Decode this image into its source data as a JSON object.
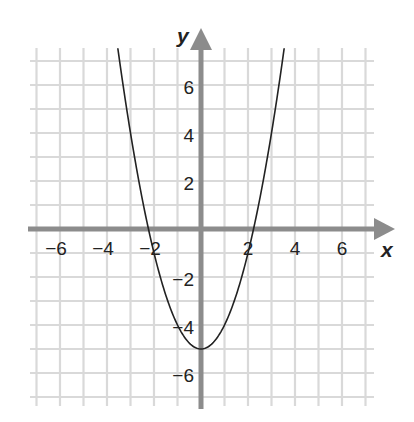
{
  "chart_data": {
    "type": "line",
    "title": "",
    "function": "y = x^2 - 5",
    "xlabel": "x",
    "ylabel": "y",
    "xlim": [
      -7,
      7
    ],
    "ylim": [
      -7,
      7
    ],
    "grid": true,
    "legend": null,
    "x_ticks": [
      -6,
      -4,
      -2,
      2,
      4,
      6
    ],
    "y_ticks": [
      6,
      4,
      2,
      -2,
      -4,
      -6
    ],
    "x_tick_labels": [
      "−6",
      "−4",
      "−2",
      "2",
      "4",
      "6"
    ],
    "y_tick_labels": [
      "6",
      "4",
      "2",
      "−2",
      "−4",
      "−6"
    ],
    "series": [
      {
        "name": "parabola",
        "x": [
          -3.54,
          -3,
          -2.5,
          -2.236,
          -2,
          -1.5,
          -1,
          -0.5,
          0,
          0.5,
          1,
          1.5,
          2,
          2.236,
          2.5,
          3,
          3.54
        ],
        "y": [
          7.53,
          4,
          1.25,
          0,
          -1,
          -2.75,
          -4,
          -4.75,
          -5,
          -4.75,
          -4,
          -2.75,
          -1,
          0,
          1.25,
          4,
          7.53
        ]
      }
    ],
    "vertex": [
      0,
      -5
    ],
    "x_intercepts": [
      -2.236,
      2.236
    ],
    "y_intercept": -5
  },
  "colors": {
    "background": "#ffffff",
    "grid": "#d9d9d9",
    "axis": "#8c8c8c",
    "curve": "#222222",
    "text": "#222222"
  }
}
